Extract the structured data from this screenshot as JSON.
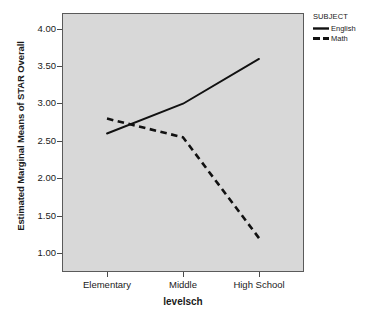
{
  "chart_data": {
    "type": "line",
    "title": "",
    "subtitle": "",
    "xlabel": "levelsch",
    "ylabel": "Estimated Marginal Means of STAR Overall",
    "categories": [
      "Elementary",
      "Middle",
      "High School"
    ],
    "series": [
      {
        "name": "English",
        "values": [
          2.6,
          3.0,
          3.6
        ],
        "style": "solid"
      },
      {
        "name": "Math",
        "values": [
          2.8,
          2.55,
          1.2
        ],
        "style": "dashed"
      }
    ],
    "ylim": [
      1.0,
      4.0
    ],
    "ytick_labels": [
      "4.00",
      "3.50",
      "3.00",
      "2.50",
      "2.00",
      "1.50",
      "1.00"
    ],
    "ytick_values": [
      4.0,
      3.5,
      3.0,
      2.5,
      2.0,
      1.5,
      1.0
    ],
    "grid": false,
    "legend_position": "top-right-outside",
    "legend_title": "SUBJECT",
    "plot_background": "#d8d8d8",
    "line_color": "#1a1a1a"
  },
  "axes": {
    "y_title": "Estimated Marginal Means of STAR Overall",
    "x_title": "levelsch",
    "y_ticks": [
      {
        "label": "4.00"
      },
      {
        "label": "3.50"
      },
      {
        "label": "3.00"
      },
      {
        "label": "2.50"
      },
      {
        "label": "2.00"
      },
      {
        "label": "1.50"
      },
      {
        "label": "1.00"
      }
    ],
    "x_ticks": [
      {
        "label": "Elementary"
      },
      {
        "label": "Middle"
      },
      {
        "label": "High School"
      }
    ]
  },
  "legend": {
    "title": "SUBJECT",
    "entries": [
      {
        "label": "English",
        "style": "solid"
      },
      {
        "label": "Math",
        "style": "dashed"
      }
    ]
  }
}
